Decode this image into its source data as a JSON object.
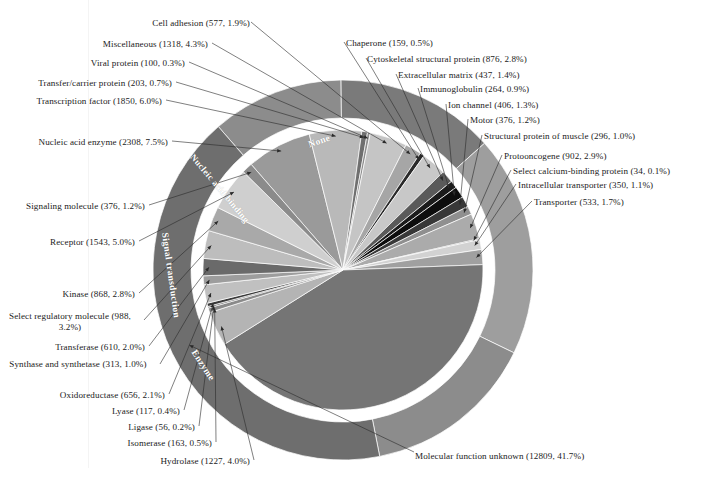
{
  "figure": {
    "background": "#ffffff",
    "center": {
      "x": 343,
      "y": 270
    },
    "inner_radius": 140,
    "outer_ring_inner_radius": 152,
    "outer_ring_outer_radius": 190
  },
  "chart_data": {
    "type": "pie",
    "xlabel": "",
    "ylabel": "",
    "total_count": 30713,
    "value_format": "name (count, percent)",
    "legend_position": "callout-labels",
    "grid": false,
    "categories": [
      "Nucleic acid enzyme",
      "Transcription factor",
      "Transfer/carrier protein",
      "Viral protein",
      "Miscellaneous",
      "Cell adhesion",
      "Chaperone",
      "Cytoskeletal structural protein",
      "Extracellular matrix",
      "Immunoglobulin",
      "Ion channel",
      "Motor",
      "Structural protein of muscle",
      "Protooncogene",
      "Select calcium-binding protein",
      "Intracellular transporter",
      "Transporter",
      "Molecular function unknown",
      "Hydrolase",
      "Isomerase",
      "Ligase",
      "Lyase",
      "Oxidoreductase",
      "Synthase and synthetase",
      "Transferase",
      "Select regulatory molecule",
      "Kinase",
      "Receptor",
      "Signaling molecule"
    ],
    "values": [
      2308,
      1850,
      203,
      100,
      1318,
      577,
      159,
      876,
      437,
      264,
      406,
      376,
      296,
      902,
      34,
      350,
      533,
      12809,
      1227,
      163,
      56,
      117,
      656,
      313,
      610,
      988,
      868,
      1543,
      376
    ],
    "percents": [
      7.5,
      6.0,
      0.7,
      0.3,
      4.3,
      1.9,
      0.5,
      2.8,
      1.4,
      0.9,
      1.3,
      1.2,
      1.0,
      2.9,
      0.1,
      1.1,
      1.7,
      41.7,
      4.0,
      0.5,
      0.2,
      0.4,
      2.1,
      1.0,
      2.0,
      3.2,
      2.8,
      5.0,
      1.2
    ],
    "colors": [
      "#9a9a9a",
      "#b9b9b9",
      "#6f6f6f",
      "#8d8d8d",
      "#c5c5c5",
      "#a6a6a6",
      "#2a2a2a",
      "#c8c8c8",
      "#5a5a5a",
      "#1b1b1b",
      "#0d0d0d",
      "#383838",
      "#8f8f8f",
      "#ababab",
      "#4b4b4b",
      "#d2d2d2",
      "#a0a0a0",
      "#757575",
      "#b4b4b4",
      "#8a8a8a",
      "#5e5e5e",
      "#3a3a3a",
      "#c0c0c0",
      "#9d9d9d",
      "#6a6a6a",
      "#bdbdbd",
      "#a9a9a9",
      "#cfcfcf",
      "#8b8b8b"
    ],
    "outer_ring": {
      "type": "pie",
      "categories": [
        "None",
        "Nucleic acid binding",
        "Signal transduction",
        "Enzyme",
        "Molecular function unknown"
      ],
      "values": [
        3448,
        4158,
        5775,
        4523,
        12809
      ],
      "colors": [
        "#8c8c8c",
        "#7a7a7a",
        "#9e9e9e",
        "#8c8c8c",
        "#6e6e6e"
      ]
    }
  },
  "ring_labels": [
    {
      "text": "None",
      "name": "ring-label-none"
    },
    {
      "text": "Nucleic acid binding",
      "name": "ring-label-nucleic-acid-binding"
    },
    {
      "text": "Signal transduction",
      "name": "ring-label-signal-transduction"
    },
    {
      "text": "Enzyme",
      "name": "ring-label-enzyme"
    }
  ],
  "callouts": {
    "cell_adhesion": "Cell adhesion (577, 1.9%)",
    "miscellaneous": "Miscellaneous (1318, 4.3%)",
    "viral_protein": "Viral protein (100, 0.3%)",
    "transfer_carrier_protein": "Transfer/carrier protein (203, 0.7%)",
    "transcription_factor": "Transcription factor (1850, 6.0%)",
    "nucleic_acid_enzyme": "Nucleic acid enzyme (2308, 7.5%)",
    "signaling_molecule": "Signaling molecule (376, 1.2%)",
    "receptor": "Receptor (1543, 5.0%)",
    "kinase": "Kinase (868, 2.8%)",
    "select_regulatory_molecule": "Select regulatory molecule (988, 3.2%)",
    "transferase": "Transferase (610, 2.0%)",
    "synthase_and_synthetase": "Synthase and synthetase (313, 1.0%)",
    "oxidoreductase": "Oxidoreductase (656, 2.1%)",
    "lyase": "Lyase (117, 0.4%)",
    "ligase": "Ligase (56, 0.2%)",
    "isomerase": "Isomerase (163, 0.5%)",
    "hydrolase": "Hydrolase (1227, 4.0%)",
    "chaperone": "Chaperone (159, 0.5%)",
    "cytoskeletal_structural_protein": "Cytoskeletal structural protein (876, 2.8%)",
    "extracellular_matrix": "Extracellular matrix (437, 1.4%)",
    "immunoglobulin": "Immunoglobulin (264, 0.9%)",
    "ion_channel": "Ion channel (406, 1.3%)",
    "motor": "Motor (376, 1.2%)",
    "structural_protein_of_muscle": "Structural protein of muscle (296, 1.0%)",
    "protooncogene": "Protooncogene (902, 2.9%)",
    "select_calcium_binding_protein": "Select calcium-binding protein (34, 0.1%)",
    "intracellular_transporter": "Intracellular transporter (350, 1.1%)",
    "transporter": "Transporter (533, 1.7%)",
    "molecular_function_unknown": "Molecular function unknown (12809, 41.7%)"
  },
  "caption": {
    "text": ""
  }
}
